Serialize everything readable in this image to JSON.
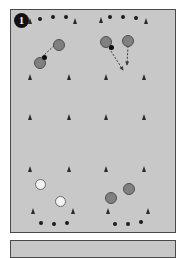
{
  "figure": {
    "type": "soccer-drill-diagram",
    "step_number": "1",
    "panel_background": "#c8c8c8",
    "panel_border": "#4a4a4a",
    "page_background": "#ffffff"
  },
  "legend_semantics": {
    "dark_player": "attacking player (shaded circle)",
    "light_player": "defending player (open circle)",
    "cone": "training cone",
    "ball": "ball",
    "arrow": "movement / pass direction"
  },
  "colors": {
    "dark_player_fill": "#808080",
    "dark_player_stroke": "#4f4f4f",
    "light_player_fill": "#f2f2f2",
    "light_player_stroke": "#6a6a6a",
    "cone": "#2a2a2a",
    "ball": "#1b1b1b",
    "arrow": "#3a3a3a"
  },
  "elements": {
    "balls": [
      {
        "name": "ball-top-left-1",
        "x": 27,
        "y": 7
      },
      {
        "name": "ball-top-left-2",
        "x": 40,
        "y": 5
      },
      {
        "name": "ball-top-left-3",
        "x": 53,
        "y": 5
      },
      {
        "name": "ball-top-right-1",
        "x": 97,
        "y": 5
      },
      {
        "name": "ball-top-right-2",
        "x": 110,
        "y": 5
      },
      {
        "name": "ball-top-right-3",
        "x": 123,
        "y": 6
      },
      {
        "name": "ball-bottom-left-1",
        "x": 28,
        "y": 211
      },
      {
        "name": "ball-bottom-left-2",
        "x": 41,
        "y": 212
      },
      {
        "name": "ball-bottom-left-3",
        "x": 54,
        "y": 211
      },
      {
        "name": "ball-bottom-right-1",
        "x": 102,
        "y": 212
      },
      {
        "name": "ball-bottom-right-2",
        "x": 115,
        "y": 212
      },
      {
        "name": "ball-bottom-right-3",
        "x": 128,
        "y": 210
      }
    ],
    "cones": [
      {
        "name": "cone-top-row-1",
        "x": 17,
        "y": 8
      },
      {
        "name": "cone-top-row-2",
        "x": 62,
        "y": 8
      },
      {
        "name": "cone-top-row-3",
        "x": 88,
        "y": 7
      },
      {
        "name": "cone-top-row-4",
        "x": 133,
        "y": 8
      },
      {
        "name": "cone-row2-1",
        "x": 17,
        "y": 64
      },
      {
        "name": "cone-row2-2",
        "x": 56,
        "y": 64
      },
      {
        "name": "cone-row2-3",
        "x": 93,
        "y": 64
      },
      {
        "name": "cone-row2-4",
        "x": 131,
        "y": 64
      },
      {
        "name": "cone-row3-1",
        "x": 17,
        "y": 104
      },
      {
        "name": "cone-row3-2",
        "x": 56,
        "y": 104
      },
      {
        "name": "cone-row3-3",
        "x": 93,
        "y": 104
      },
      {
        "name": "cone-row3-4",
        "x": 131,
        "y": 104
      },
      {
        "name": "cone-row4-1",
        "x": 17,
        "y": 156
      },
      {
        "name": "cone-row4-2",
        "x": 56,
        "y": 156
      },
      {
        "name": "cone-row4-3",
        "x": 93,
        "y": 156
      },
      {
        "name": "cone-row4-4",
        "x": 131,
        "y": 156
      },
      {
        "name": "cone-bottom-row-1",
        "x": 20,
        "y": 198
      },
      {
        "name": "cone-bottom-row-2",
        "x": 60,
        "y": 198
      },
      {
        "name": "cone-bottom-row-3",
        "x": 95,
        "y": 198
      },
      {
        "name": "cone-bottom-row-4",
        "x": 135,
        "y": 198
      }
    ],
    "players_dark": [
      {
        "name": "player-dark-top-left-passer",
        "x": 23,
        "y": 47
      },
      {
        "name": "player-dark-top-left-receiver",
        "x": 42,
        "y": 29
      },
      {
        "name": "player-dark-top-right-left",
        "x": 89,
        "y": 26
      },
      {
        "name": "player-dark-top-right-right",
        "x": 111,
        "y": 25
      },
      {
        "name": "player-dark-bottom-right-left",
        "x": 94,
        "y": 182
      },
      {
        "name": "player-dark-bottom-right-right",
        "x": 112,
        "y": 173
      }
    ],
    "players_light": [
      {
        "name": "player-light-bottom-left-upper",
        "x": 24,
        "y": 169
      },
      {
        "name": "player-light-bottom-left-lower",
        "x": 44,
        "y": 186
      }
    ],
    "mini_balls": [
      {
        "name": "ball-at-passer-top-left",
        "x": 31,
        "y": 45
      },
      {
        "name": "ball-at-player-top-right",
        "x": 98,
        "y": 35
      }
    ],
    "arrows": [
      {
        "name": "arrow-pass-top-left",
        "x1": 31,
        "y1": 47,
        "x2": 46,
        "y2": 33
      },
      {
        "name": "arrow-run-top-right-diagonal",
        "x1": 98,
        "y1": 38,
        "x2": 112,
        "y2": 60
      },
      {
        "name": "arrow-run-top-right-down",
        "x1": 117,
        "y1": 36,
        "x2": 116,
        "y2": 55
      }
    ]
  }
}
